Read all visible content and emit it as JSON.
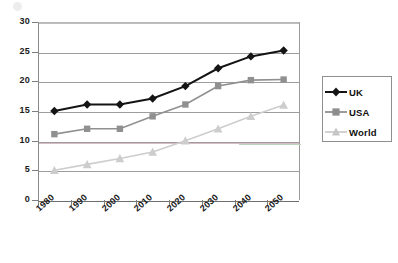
{
  "chart_data": {
    "type": "line",
    "title": "",
    "subtitle": "",
    "xlabel": "",
    "ylabel": "",
    "x": [
      1985,
      1995,
      2005,
      2015,
      2025,
      2035,
      2045,
      2055
    ],
    "xtick_labels": [
      "1980",
      "1990",
      "2000",
      "2010",
      "2020",
      "2030",
      "2040",
      "2050"
    ],
    "xtick_values": [
      1980,
      1990,
      2000,
      2010,
      2020,
      2030,
      2040,
      2050
    ],
    "ytick_labels": [
      "0",
      "5",
      "10",
      "15",
      "20",
      "25",
      "30"
    ],
    "ytick_values": [
      0,
      5,
      10,
      15,
      20,
      25,
      30
    ],
    "ylim": [
      0,
      30
    ],
    "xlim": [
      1980,
      2060
    ],
    "grid": true,
    "legend_position": "right",
    "series": [
      {
        "name": "UK",
        "marker": "diamond",
        "color": "#141414",
        "values": [
          15.0,
          16.1,
          16.1,
          17.1,
          19.2,
          22.2,
          24.2,
          25.2
        ]
      },
      {
        "name": "USA",
        "marker": "square",
        "color": "#909090",
        "values": [
          11.1,
          12.0,
          12.0,
          14.1,
          16.1,
          19.2,
          20.2,
          20.3
        ]
      },
      {
        "name": "World",
        "marker": "triangle",
        "color": "#cdcdcd",
        "values": [
          5.0,
          6.0,
          7.0,
          8.1,
          10.0,
          12.0,
          14.1,
          16.0
        ]
      }
    ]
  },
  "legend": {
    "items": [
      {
        "label": "UK"
      },
      {
        "label": "USA"
      },
      {
        "label": "World"
      }
    ]
  }
}
